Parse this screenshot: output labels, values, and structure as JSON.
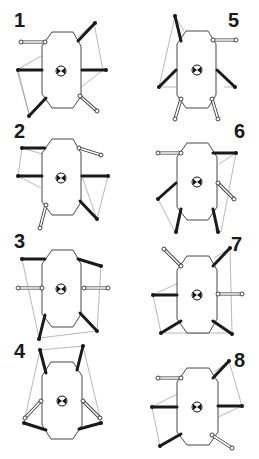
{
  "figure": {
    "colors": {
      "stance_leg": "#1a1a1a",
      "swing_leg": "#ffffff",
      "outline": "#333333",
      "support_line": "#777777"
    },
    "panels": [
      {
        "id": 1,
        "label": "1",
        "cx": 60,
        "cy": 70,
        "label_x": 14,
        "label_y": 10,
        "legs": {
          "front_left": "swing",
          "front_right": "stance",
          "mid_left": "stance",
          "mid_right": "stance",
          "rear_left": "stance",
          "rear_right": "swing"
        }
      },
      {
        "id": 2,
        "label": "2",
        "cx": 60,
        "cy": 177,
        "label_x": 14,
        "label_y": 121,
        "legs": {
          "front_left": "stance",
          "front_right": "swing",
          "mid_left": "stance",
          "mid_right": "stance",
          "rear_left": "swing",
          "rear_right": "stance"
        }
      },
      {
        "id": 3,
        "label": "3",
        "cx": 60,
        "cy": 287,
        "label_x": 14,
        "label_y": 231,
        "legs": {
          "front_left": "stance",
          "front_right": "stance",
          "mid_left": "swing",
          "mid_right": "swing",
          "rear_left": "stance",
          "rear_right": "stance"
        }
      },
      {
        "id": 4,
        "label": "4",
        "cx": 60,
        "cy": 400,
        "label_x": 14,
        "label_y": 341,
        "legs": {
          "front_left": "stance",
          "front_right": "stance",
          "mid_left": "swing",
          "mid_right": "swing",
          "rear_left": "stance",
          "rear_right": "stance"
        }
      },
      {
        "id": 5,
        "label": "5",
        "cx": 196,
        "cy": 70,
        "label_x": 228,
        "label_y": 10,
        "legs": {
          "front_left": "stance",
          "front_right": "swing",
          "mid_left": "stance",
          "mid_right": "stance",
          "rear_left": "swing",
          "rear_right": "swing"
        }
      },
      {
        "id": 6,
        "label": "6",
        "cx": 197,
        "cy": 180,
        "label_x": 234,
        "label_y": 121,
        "legs": {
          "front_left": "swing",
          "front_right": "stance",
          "mid_left": "stance",
          "mid_right": "swing",
          "rear_left": "stance",
          "rear_right": "stance"
        }
      },
      {
        "id": 7,
        "label": "7",
        "cx": 197,
        "cy": 293,
        "label_x": 231,
        "label_y": 234,
        "legs": {
          "front_left": "swing",
          "front_right": "stance",
          "mid_left": "stance",
          "mid_right": "swing",
          "rear_left": "stance",
          "rear_right": "stance"
        }
      },
      {
        "id": 8,
        "label": "8",
        "cx": 197,
        "cy": 406,
        "label_x": 234,
        "label_y": 350,
        "legs": {
          "front_left": "swing",
          "front_right": "stance",
          "mid_left": "stance",
          "mid_right": "stance",
          "rear_left": "stance",
          "rear_right": "swing"
        }
      }
    ]
  }
}
